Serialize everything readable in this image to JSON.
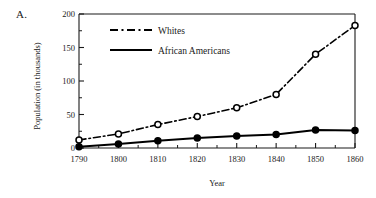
{
  "panel": {
    "label": "A."
  },
  "chart_data": {
    "type": "line",
    "title": "",
    "xlabel": "Year",
    "ylabel": "Population (in thousands)",
    "x": [
      1790,
      1800,
      1810,
      1820,
      1830,
      1840,
      1850,
      1860
    ],
    "categories": [
      "1790",
      "1800",
      "1810",
      "1820",
      "1830",
      "1840",
      "1850",
      "1860"
    ],
    "xlim": [
      1790,
      1860
    ],
    "ylim": [
      0,
      200
    ],
    "yticks": [
      0,
      50,
      100,
      150,
      200
    ],
    "ytick_labels": [
      "0",
      "50",
      "100",
      "150",
      "200"
    ],
    "grid": false,
    "legend_position": "top-left",
    "series": [
      {
        "name": "Whites",
        "style": "dash-dot",
        "marker": "open-circle",
        "color": "#000000",
        "values": [
          12,
          21,
          35,
          47,
          60,
          80,
          140,
          183
        ]
      },
      {
        "name": "African Americans",
        "style": "solid",
        "marker": "filled-circle",
        "color": "#000000",
        "values": [
          2,
          6,
          11,
          15,
          18,
          20,
          27,
          26
        ]
      }
    ]
  }
}
